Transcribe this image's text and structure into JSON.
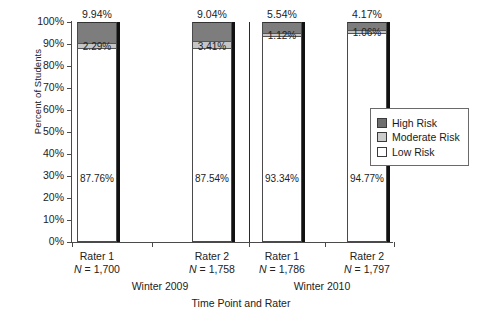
{
  "chart_data": {
    "type": "bar",
    "subtype": "stacked-bar-100",
    "title": "",
    "xlabel": "Time Point and Rater",
    "ylabel": "Percent of Students",
    "ylim": [
      0,
      100
    ],
    "ytick_labels": [
      "0%",
      "10%",
      "20%",
      "30%",
      "40%",
      "50%",
      "60%",
      "70%",
      "80%",
      "90%",
      "100%"
    ],
    "ytick_values": [
      0,
      10,
      20,
      30,
      40,
      50,
      60,
      70,
      80,
      90,
      100
    ],
    "grid": false,
    "legend_position": "right",
    "categories": [
      "Rater 1",
      "Rater 2",
      "Rater 1",
      "Rater 2"
    ],
    "group_labels": [
      "Winter 2009",
      "Winter 2010"
    ],
    "series": [
      {
        "name": "Low Risk",
        "color": "#ffffff",
        "values": [
          87.76,
          87.54,
          93.34,
          94.77
        ]
      },
      {
        "name": "Moderate Risk",
        "color": "#c6c6c6",
        "values": [
          2.29,
          3.41,
          1.12,
          1.06
        ]
      },
      {
        "name": "High Risk",
        "color": "#7d7d7d",
        "values": [
          9.94,
          9.04,
          5.54,
          4.17
        ]
      }
    ],
    "bars": [
      {
        "rater": "Rater 1",
        "n_label": "N = 1,700",
        "group": "Winter 2009",
        "low": "87.76%",
        "moderate": "2.29%",
        "high": "9.94%",
        "low_v": 87.76,
        "moderate_v": 2.29,
        "high_v": 9.94
      },
      {
        "rater": "Rater 2",
        "n_label": "N = 1,758",
        "group": "Winter 2009",
        "low": "87.54%",
        "moderate": "3.41%",
        "high": "9.04%",
        "low_v": 87.54,
        "moderate_v": 3.41,
        "high_v": 9.04
      },
      {
        "rater": "Rater 1",
        "n_label": "N = 1,786",
        "group": "Winter 2010",
        "low": "93.34%",
        "moderate": "1.12%",
        "high": "5.54%",
        "low_v": 93.34,
        "moderate_v": 1.12,
        "high_v": 5.54
      },
      {
        "rater": "Rater 2",
        "n_label": "N = 1,797",
        "group": "Winter 2010",
        "low": "94.77%",
        "moderate": "1.06%",
        "high": "4.17%",
        "low_v": 94.77,
        "moderate_v": 1.06,
        "high_v": 4.17
      }
    ],
    "legend": [
      {
        "label": "High Risk",
        "color": "#6f6f6f"
      },
      {
        "label": "Moderate Risk",
        "color": "#cccccc"
      },
      {
        "label": "Low Risk",
        "color": "#ffffff"
      }
    ]
  }
}
